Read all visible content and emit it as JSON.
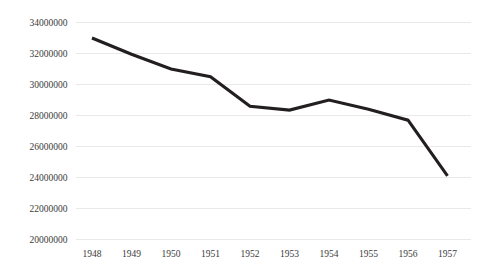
{
  "chart_data": {
    "type": "line",
    "title": "",
    "subtitle": "",
    "xlabel": "",
    "ylabel": "",
    "categories": [
      "1948",
      "1949",
      "1950",
      "1951",
      "1952",
      "1953",
      "1954",
      "1955",
      "1956",
      "1957"
    ],
    "x": [
      1948,
      1949,
      1950,
      1951,
      1952,
      1953,
      1954,
      1955,
      1956,
      1957
    ],
    "values": [
      33000000,
      31950000,
      31000000,
      30500000,
      28600000,
      28350000,
      29000000,
      28400000,
      27700000,
      24100000
    ],
    "series": [
      {
        "name": "",
        "values": [
          33000000,
          31950000,
          31000000,
          30500000,
          28600000,
          28350000,
          29000000,
          28400000,
          27700000,
          24100000
        ],
        "color": "#231f20"
      }
    ],
    "ylim": [
      20000000,
      34000000
    ],
    "ytick_values": [
      20000000,
      22000000,
      24000000,
      26000000,
      28000000,
      30000000,
      32000000,
      34000000
    ],
    "ytick_labels": [
      "20000000",
      "22000000",
      "24000000",
      "26000000",
      "28000000",
      "30000000",
      "32000000",
      "34000000"
    ],
    "xtick_labels": [
      "1948",
      "1949",
      "1950",
      "1951",
      "1952",
      "1953",
      "1954",
      "1955",
      "1956",
      "1957"
    ],
    "grid": {
      "horizontal": true,
      "vertical": false,
      "color": "#e9e9e9"
    },
    "legend": {
      "visible": false,
      "position": "none",
      "entries": []
    },
    "annotations": [],
    "background_color": "#ffffff",
    "line_color": "#231f20",
    "tick_label_color": "#3a3a3a"
  }
}
